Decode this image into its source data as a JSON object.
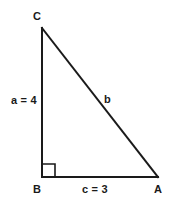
{
  "diagram": {
    "type": "right-triangle",
    "background_color": "#ffffff",
    "stroke_color": "#1a1a1a",
    "text_color": "#1a1a1a",
    "stroke_width": 2,
    "vertices": [
      {
        "id": "C",
        "label": "C",
        "x": 42,
        "y": 28,
        "angle_type": "acute"
      },
      {
        "id": "B",
        "label": "B",
        "x": 42,
        "y": 177,
        "angle_type": "right"
      },
      {
        "id": "A",
        "label": "A",
        "x": 158,
        "y": 177,
        "angle_type": "acute"
      }
    ],
    "sides": [
      {
        "id": "a",
        "label": "a = 4",
        "name": "a",
        "value": 4,
        "from": "B",
        "to": "C",
        "kind": "leg"
      },
      {
        "id": "b",
        "label": "b",
        "name": "b",
        "value": null,
        "from": "C",
        "to": "A",
        "kind": "hypotenuse"
      },
      {
        "id": "c",
        "label": "c = 3",
        "name": "c",
        "value": 3,
        "from": "B",
        "to": "A",
        "kind": "leg"
      }
    ],
    "right_angle_marker": {
      "at_vertex": "B",
      "size": 13,
      "shape": "square"
    }
  }
}
